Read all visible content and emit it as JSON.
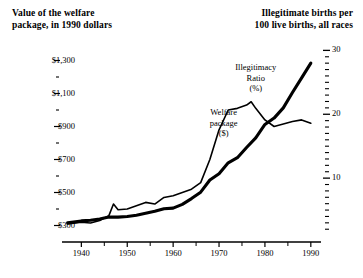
{
  "header": {
    "left_title": "Value of the welfare\npackage, in 1990 dollars",
    "left_line1": "Value of the welfare",
    "left_line2": "package, in 1990 dollars",
    "right_line1": "Illegitimate births per",
    "right_line2": "100 live births, all races"
  },
  "annotations": {
    "welfare_l1": "Welfare",
    "welfare_l2": "package",
    "welfare_l3": "($)",
    "ratio_l1": "Illegitimacy",
    "ratio_l2": "Ratio",
    "ratio_l3": "(%)"
  },
  "axes": {
    "left_ticks": [
      "$1,300",
      "$1,100",
      "$900",
      "$700",
      "$500",
      "$300"
    ],
    "left_values": [
      1300,
      1100,
      900,
      700,
      500,
      300
    ],
    "left_minor_values": [
      1200,
      1000,
      800,
      600,
      400
    ],
    "left_range": [
      200,
      1400
    ],
    "right_ticks": [
      "30",
      "20",
      "10"
    ],
    "right_values": [
      30,
      20,
      10
    ],
    "right_minor_values": [
      29,
      28,
      27,
      26,
      25,
      24,
      23,
      22,
      21,
      19,
      18,
      17,
      16,
      15,
      14,
      13,
      12,
      11,
      9,
      8,
      7,
      6,
      5,
      4,
      3,
      2
    ],
    "right_range": [
      0,
      31
    ],
    "x_ticks": [
      "1940",
      "1950",
      "1960",
      "1970",
      "1980",
      "1990"
    ],
    "x_values": [
      1940,
      1950,
      1960,
      1970,
      1980,
      1990
    ],
    "x_minor_values": [
      1945,
      1955,
      1965,
      1975,
      1985
    ],
    "x_range": [
      1936,
      1992
    ]
  },
  "colors": {
    "line": "#000000",
    "axis": "#000000",
    "background": "#ffffff"
  },
  "chart_data": {
    "type": "line",
    "title": "",
    "xlabel": "",
    "ylabel": "Value of the welfare package, in 1990 dollars",
    "y2label": "Illegitimate births per 100 live births, all races",
    "xlim": [
      1936,
      1992
    ],
    "ylim": [
      200,
      1400
    ],
    "y2lim": [
      0,
      31
    ],
    "grid": false,
    "legend": "inline-annotations",
    "series": [
      {
        "name": "Welfare package ($)",
        "axis": "left",
        "style": "thin",
        "unit": "1990 dollars",
        "x": [
          1937,
          1940,
          1942,
          1944,
          1946,
          1947,
          1948,
          1950,
          1952,
          1954,
          1956,
          1958,
          1960,
          1962,
          1964,
          1966,
          1968,
          1970,
          1972,
          1974,
          1976,
          1977,
          1978,
          1980,
          1982,
          1984,
          1986,
          1988,
          1990
        ],
        "values": [
          310,
          320,
          315,
          330,
          360,
          430,
          395,
          400,
          420,
          440,
          430,
          470,
          480,
          500,
          520,
          560,
          700,
          880,
          1000,
          1010,
          1030,
          1050,
          1010,
          940,
          900,
          915,
          930,
          940,
          920
        ]
      },
      {
        "name": "Illegitimacy Ratio (%)",
        "axis": "right",
        "style": "thick",
        "unit": "percent of live births",
        "x": [
          1937,
          1940,
          1942,
          1944,
          1946,
          1948,
          1950,
          1952,
          1954,
          1956,
          1958,
          1960,
          1962,
          1964,
          1966,
          1968,
          1970,
          1972,
          1974,
          1976,
          1978,
          1980,
          1982,
          1984,
          1986,
          1988,
          1990
        ],
        "values": [
          3.0,
          3.3,
          3.4,
          3.6,
          3.9,
          3.9,
          4.0,
          4.2,
          4.5,
          4.8,
          5.2,
          5.3,
          5.9,
          6.8,
          7.8,
          9.7,
          10.7,
          12.4,
          13.2,
          14.8,
          16.3,
          18.4,
          19.4,
          21.0,
          23.4,
          25.7,
          28.0
        ]
      }
    ]
  }
}
